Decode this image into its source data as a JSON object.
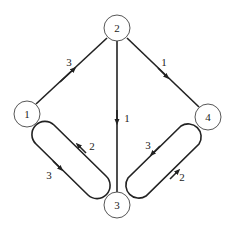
{
  "nodes": [
    {
      "id": "1",
      "label": "1",
      "x": 27,
      "y": 114
    },
    {
      "id": "2",
      "label": "2",
      "x": 117,
      "y": 28
    },
    {
      "id": "3",
      "label": "3",
      "x": 117,
      "y": 205
    },
    {
      "id": "4",
      "label": "4",
      "x": 208,
      "y": 117
    }
  ],
  "edges": [
    {
      "from": "1",
      "to": "2",
      "weight": "3"
    },
    {
      "from": "2",
      "to": "4",
      "weight": "1"
    },
    {
      "from": "2",
      "to": "3",
      "weight": "1"
    },
    {
      "from": "1",
      "to": "3",
      "weight": "3"
    },
    {
      "from": "3",
      "to": "1",
      "weight": "2"
    },
    {
      "from": "4",
      "to": "3",
      "weight": "3"
    },
    {
      "from": "3",
      "to": "4",
      "weight": "2"
    }
  ],
  "colors": {
    "stroke": "#222222",
    "background": "#ffffff"
  }
}
